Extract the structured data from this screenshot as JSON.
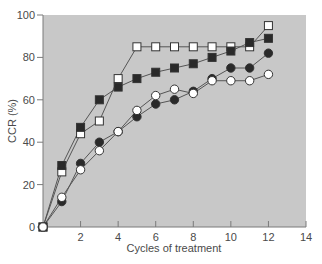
{
  "chart_data": {
    "type": "line",
    "title": "",
    "xlabel": "Cycles of treatment",
    "ylabel": "CCR (%)",
    "xlim": [
      0,
      14
    ],
    "ylim": [
      0,
      100
    ],
    "x_ticks": [
      2,
      4,
      6,
      8,
      10,
      12,
      14
    ],
    "y_ticks": [
      0,
      20,
      40,
      60,
      80,
      100
    ],
    "grid": false,
    "legend": null,
    "plot_background": "#c8c8c8",
    "x": [
      0,
      1,
      2,
      3,
      4,
      5,
      6,
      7,
      8,
      9,
      10,
      11,
      12
    ],
    "series": [
      {
        "name": "open-square",
        "marker": "square",
        "fill": "#ffffff",
        "values": [
          0,
          26,
          44,
          50,
          70,
          85,
          85,
          85,
          85,
          85,
          85,
          85,
          95
        ]
      },
      {
        "name": "filled-square",
        "marker": "square",
        "fill": "#2a2a2a",
        "values": [
          0,
          29,
          47,
          60,
          66,
          70,
          73,
          75,
          77,
          80,
          83,
          87,
          89
        ]
      },
      {
        "name": "filled-circle",
        "marker": "circle",
        "fill": "#2a2a2a",
        "values": [
          0,
          12,
          30,
          40,
          45,
          52,
          58,
          60,
          64,
          70,
          75,
          75,
          82
        ]
      },
      {
        "name": "open-circle",
        "marker": "circle",
        "fill": "#ffffff",
        "values": [
          0,
          14,
          27,
          36,
          45,
          55,
          62,
          65,
          63,
          69,
          69,
          69,
          72
        ]
      }
    ]
  }
}
